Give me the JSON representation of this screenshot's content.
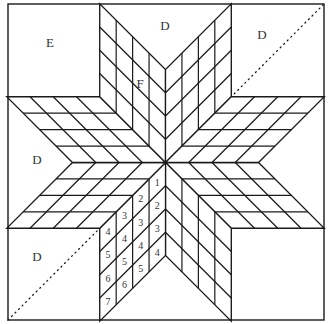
{
  "diagram": {
    "type": "lone-star-quilt-block",
    "stroke_color": "#1a1a1a",
    "background": "#ffffff",
    "outer_square": {
      "x1": 8,
      "y1": 4,
      "x2": 324,
      "y2": 320
    },
    "center": {
      "x": 165.5,
      "y": 162.5
    },
    "arm_length": 93,
    "grid_divisions": 4,
    "corner_square_size": 91,
    "region_labels": [
      {
        "id": "corner-top-left",
        "text": "E",
        "x": 50,
        "y": 47
      },
      {
        "id": "triangle-top",
        "text": "D",
        "x": 165,
        "y": 30
      },
      {
        "id": "corner-top-right",
        "text": "D",
        "x": 262,
        "y": 39
      },
      {
        "id": "diamond-top-left",
        "text": "F",
        "x": 140,
        "y": 88
      },
      {
        "id": "triangle-left",
        "text": "D",
        "x": 37,
        "y": 164
      },
      {
        "id": "corner-bottom-left",
        "text": "D",
        "x": 37,
        "y": 261
      }
    ],
    "dotted_diagonal": {
      "x1": 8,
      "y1": 320,
      "x2": 324,
      "y2": 4
    },
    "numbered_arm": {
      "description": "lower-left vertical diamond, cell numbers = column + row - 1",
      "cells": [
        [
          1,
          2,
          3,
          4
        ],
        [
          2,
          3,
          4,
          5
        ],
        [
          3,
          4,
          5,
          6
        ],
        [
          4,
          5,
          6,
          7
        ]
      ]
    }
  }
}
